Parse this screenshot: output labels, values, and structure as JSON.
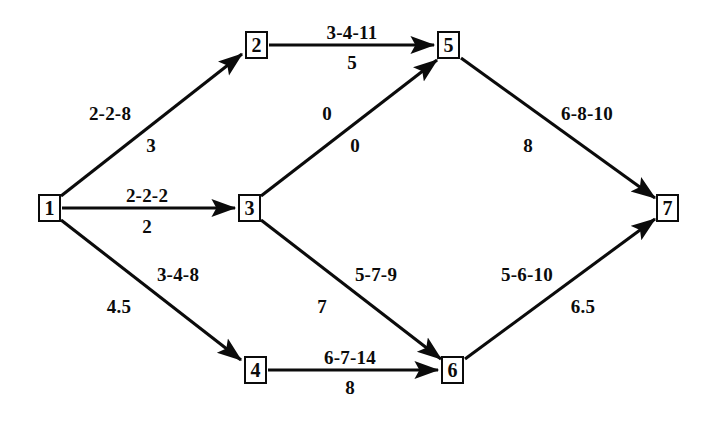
{
  "diagram": {
    "type": "directed-network",
    "background_color": "#ffffff",
    "line_color": "#0b0b0b",
    "nodes": [
      {
        "id": "n1",
        "label": "1",
        "cx": 49,
        "cy": 208
      },
      {
        "id": "n2",
        "label": "2",
        "cx": 256,
        "cy": 45
      },
      {
        "id": "n3",
        "label": "3",
        "cx": 249,
        "cy": 208
      },
      {
        "id": "n4",
        "label": "4",
        "cx": 255,
        "cy": 370
      },
      {
        "id": "n5",
        "label": "5",
        "cx": 448,
        "cy": 45
      },
      {
        "id": "n6",
        "label": "6",
        "cx": 452,
        "cy": 370
      },
      {
        "id": "n7",
        "label": "7",
        "cx": 667,
        "cy": 208
      }
    ],
    "edges": [
      {
        "id": "e1-2",
        "from": "1",
        "to": "2",
        "estimate": "2-2-8",
        "duration": "3",
        "estimate_pos": {
          "x": 110,
          "y": 113
        },
        "duration_pos": {
          "x": 151,
          "y": 145
        }
      },
      {
        "id": "e1-3",
        "from": "1",
        "to": "3",
        "estimate": "2-2-2",
        "duration": "2",
        "estimate_pos": {
          "x": 147,
          "y": 195
        },
        "duration_pos": {
          "x": 147,
          "y": 226
        }
      },
      {
        "id": "e1-4",
        "from": "1",
        "to": "4",
        "estimate": "3-4-8",
        "duration": "4.5",
        "estimate_pos": {
          "x": 178,
          "y": 274
        },
        "duration_pos": {
          "x": 119,
          "y": 306
        }
      },
      {
        "id": "e2-5",
        "from": "2",
        "to": "5",
        "estimate": "3-4-11",
        "duration": "5",
        "estimate_pos": {
          "x": 352,
          "y": 32
        },
        "duration_pos": {
          "x": 352,
          "y": 62
        }
      },
      {
        "id": "e3-5",
        "from": "3",
        "to": "5",
        "estimate": "0",
        "duration": "0",
        "estimate_pos": {
          "x": 327,
          "y": 113
        },
        "duration_pos": {
          "x": 355,
          "y": 145
        }
      },
      {
        "id": "e3-6",
        "from": "3",
        "to": "6",
        "estimate": "5-7-9",
        "duration": "7",
        "estimate_pos": {
          "x": 376,
          "y": 274
        },
        "duration_pos": {
          "x": 322,
          "y": 306
        }
      },
      {
        "id": "e4-6",
        "from": "4",
        "to": "6",
        "estimate": "6-7-14",
        "duration": "8",
        "estimate_pos": {
          "x": 350,
          "y": 357
        },
        "duration_pos": {
          "x": 350,
          "y": 387
        }
      },
      {
        "id": "e5-7",
        "from": "5",
        "to": "7",
        "estimate": "6-8-10",
        "duration": "8",
        "estimate_pos": {
          "x": 587,
          "y": 113
        },
        "duration_pos": {
          "x": 528,
          "y": 145
        }
      },
      {
        "id": "e6-7",
        "from": "6",
        "to": "7",
        "estimate": "5-6-10",
        "duration": "6.5",
        "estimate_pos": {
          "x": 527,
          "y": 274
        },
        "duration_pos": {
          "x": 583,
          "y": 306
        }
      }
    ]
  }
}
